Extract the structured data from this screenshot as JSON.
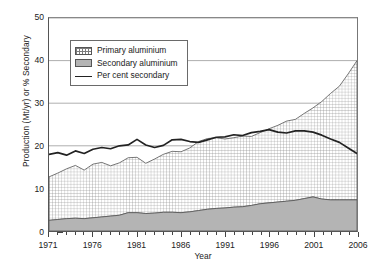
{
  "chart_data": {
    "type": "area",
    "title": "",
    "xlabel": "Year",
    "ylabel": "Production (Mt/yr) or % Secondary",
    "xlim": [
      1971,
      2006
    ],
    "ylim": [
      0,
      50
    ],
    "grid": true,
    "legend_position": "upper-left-inside",
    "x_tick_labels": [
      "1971",
      "1976",
      "1981",
      "1986",
      "1991",
      "1996",
      "2001",
      "2006"
    ],
    "x_tick_values": [
      1971,
      1976,
      1981,
      1986,
      1991,
      1996,
      2001,
      2006
    ],
    "y_tick_labels": [
      "0",
      "10",
      "20",
      "30",
      "40",
      "50"
    ],
    "y_tick_values": [
      0,
      10,
      20,
      30,
      40,
      50
    ],
    "x": [
      1971,
      1972,
      1973,
      1974,
      1975,
      1976,
      1977,
      1978,
      1979,
      1980,
      1981,
      1982,
      1983,
      1984,
      1985,
      1986,
      1987,
      1988,
      1989,
      1990,
      1991,
      1992,
      1993,
      1994,
      1995,
      1996,
      1997,
      1998,
      1999,
      2000,
      2001,
      2002,
      2003,
      2004,
      2005,
      2006
    ],
    "series": [
      {
        "name": "Secondary aluminium",
        "style": "filled-area-gray",
        "color": "#b4b4b4",
        "values": [
          2.5,
          2.7,
          2.9,
          3.0,
          2.9,
          3.1,
          3.3,
          3.5,
          3.7,
          4.3,
          4.3,
          4.1,
          4.2,
          4.4,
          4.4,
          4.3,
          4.5,
          4.8,
          5.1,
          5.3,
          5.4,
          5.6,
          5.7,
          6.0,
          6.4,
          6.6,
          6.8,
          7.0,
          7.2,
          7.6,
          8.0,
          7.5,
          7.3,
          7.3,
          7.3,
          7.3
        ]
      },
      {
        "name": "Primary aluminium",
        "style": "filled-area-crosshatch",
        "color": "#ffffff",
        "note": "plotted as cumulative total with secondary; values below are the upper boundary (total) of the crosshatched band",
        "values": [
          12.7,
          13.6,
          14.6,
          15.4,
          14.3,
          15.7,
          16.1,
          15.3,
          16.0,
          17.2,
          17.3,
          15.9,
          16.9,
          18.0,
          18.7,
          18.6,
          19.5,
          21.0,
          21.7,
          21.9,
          21.6,
          21.9,
          22.3,
          22.2,
          23.1,
          24.0,
          24.8,
          25.8,
          26.2,
          27.6,
          28.9,
          30.4,
          32.3,
          34.0,
          36.9,
          40.0
        ]
      },
      {
        "name": "Per cent secondary",
        "style": "line",
        "color": "#222222",
        "values": [
          18.0,
          18.4,
          17.8,
          18.8,
          18.2,
          19.2,
          19.6,
          19.3,
          20.0,
          20.2,
          21.5,
          20.2,
          19.6,
          20.1,
          21.4,
          21.5,
          21.0,
          20.8,
          21.4,
          22.0,
          22.1,
          22.6,
          22.4,
          23.1,
          23.4,
          23.8,
          23.2,
          23.0,
          23.5,
          23.5,
          23.2,
          22.5,
          21.6,
          20.8,
          19.5,
          18.2
        ]
      }
    ]
  },
  "legend": {
    "items": [
      {
        "label": "Primary aluminium",
        "swatch": "crosshatch-swatch"
      },
      {
        "label": "Secondary aluminium",
        "swatch": "solid-gray-swatch"
      },
      {
        "label": "Per cent secondary",
        "swatch": "line-swatch"
      }
    ]
  },
  "axes": {
    "y_label": "Production (Mt/yr) or % Secondary",
    "x_label": "Year"
  },
  "colors": {
    "secondary_fill": "#b4b4b4",
    "primary_fill": "#ffffff",
    "hatch": "#7d7d7d",
    "line": "#222222",
    "gridline": "#9a9a9a",
    "frame": "#555555"
  }
}
